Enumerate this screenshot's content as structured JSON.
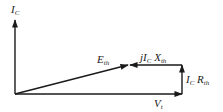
{
  "diagram": {
    "title": "",
    "type": "phasor-diagram",
    "stroke_color": "#1a1a1a",
    "background": "#ffffff",
    "labels": {
      "ic_axis": {
        "main": "I",
        "sub": "C"
      },
      "eth": {
        "main": "E",
        "sub": "th"
      },
      "jicxth": {
        "prefix": "jI",
        "sub1": "C",
        "mid": " X",
        "sub2": "th"
      },
      "icrth": {
        "main": "I",
        "sub1": "C",
        "mid": " R",
        "sub2": "th"
      },
      "vt": {
        "main": "V",
        "sub": "t"
      }
    },
    "vectors": [
      {
        "name": "I_C axis",
        "from": [
          15,
          94
        ],
        "to": [
          15,
          20
        ]
      },
      {
        "name": "V_t",
        "from": [
          15,
          94
        ],
        "to": [
          182,
          94
        ]
      },
      {
        "name": "I_C R_th",
        "from": [
          182,
          94
        ],
        "to": [
          182,
          65
        ]
      },
      {
        "name": "jI_C X_th",
        "from": [
          182,
          65
        ],
        "to": [
          130,
          65
        ]
      },
      {
        "name": "E_th",
        "from": [
          15,
          94
        ],
        "to": [
          128,
          65
        ]
      }
    ]
  }
}
